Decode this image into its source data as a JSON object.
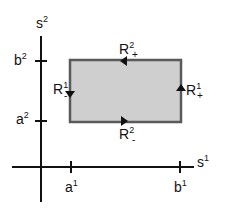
{
  "diagram": {
    "axes": {
      "x_label": "s",
      "x_label_sup": "1",
      "y_label": "s",
      "y_label_sup": "2"
    },
    "ticks": {
      "a1": {
        "base": "a",
        "sup": "1"
      },
      "b1": {
        "base": "b",
        "sup": "1"
      },
      "a2": {
        "base": "a",
        "sup": "2"
      },
      "b2": {
        "base": "b",
        "sup": "2"
      }
    },
    "region": {
      "fill": "#cfcfcf",
      "border": "#5a5a5a"
    },
    "edges": {
      "top": {
        "base": "R",
        "sup": "2",
        "sub": "+",
        "direction": "left"
      },
      "right": {
        "base": "R",
        "sup": "1",
        "sub": "+",
        "direction": "up"
      },
      "bottom": {
        "base": "R",
        "sup": "2",
        "sub": "-",
        "direction": "right"
      },
      "left": {
        "base": "R",
        "sup": "1",
        "sub": "-",
        "direction": "down"
      }
    }
  }
}
